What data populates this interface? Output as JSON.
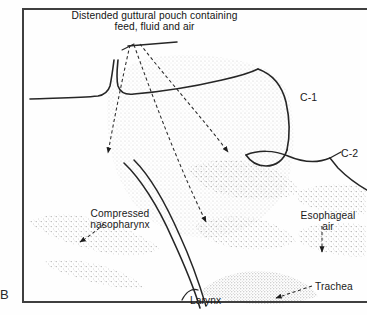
{
  "figure": {
    "panel_letter": "B",
    "title_line1": "Distended guttural pouch containing",
    "title_line2": "feed, fluid and air",
    "background_color": "#fefefe",
    "ink_color": "#1a1a1a",
    "stipple_color": "#9a9a9a",
    "frame_color": "#444444"
  },
  "labels": {
    "c1": "C-1",
    "c2": "C-2",
    "nasopharynx_line1": "Compressed",
    "nasopharynx_line2": "nasopharynx",
    "esophageal_line1": "Esophageal",
    "esophageal_line2": "air",
    "trachea": "Trachea",
    "larynx": "Larynx"
  },
  "annotations": {
    "leader_count": 3,
    "leader_style": "dashed-with-arrowhead",
    "underline_present": true
  }
}
